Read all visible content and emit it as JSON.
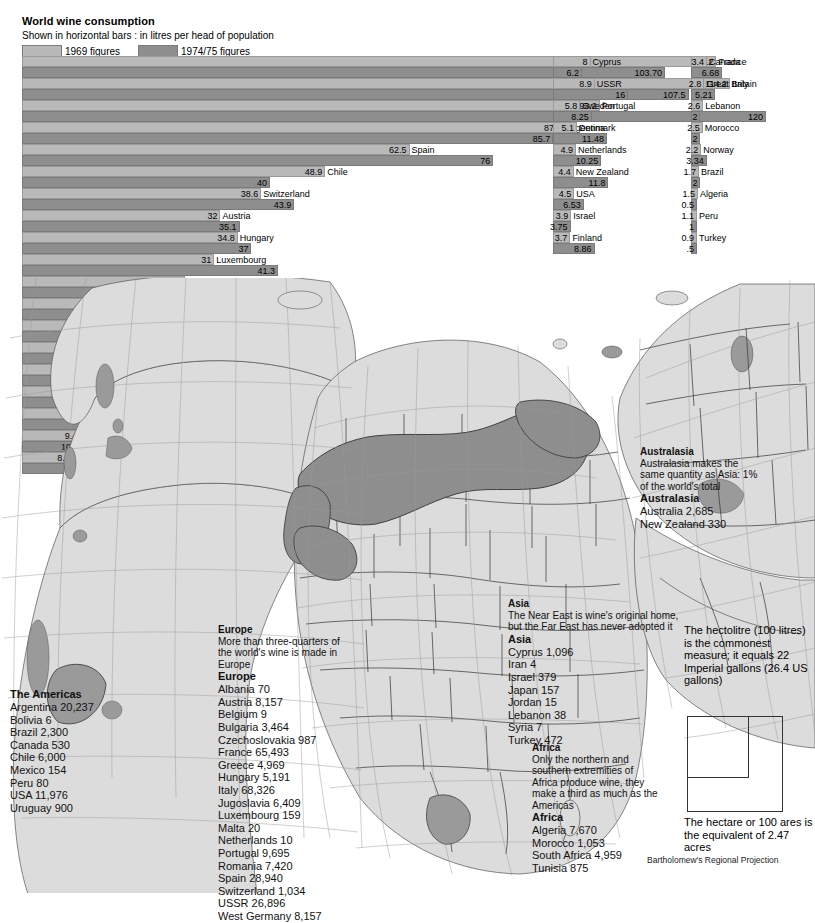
{
  "header": {
    "title": "World wine consumption",
    "subtitle": "Shown in horizontal bars : in litres per head of population",
    "legend": [
      {
        "label": "1969 figures",
        "color": "#b9b9b9"
      },
      {
        "label": "1974/75 figures",
        "color": "#8e8e8e"
      }
    ]
  },
  "chart_data": {
    "type": "bar",
    "title": "World wine consumption",
    "subtitle": "Shown in horizontal bars : in litres per head of population",
    "xlabel": "litres per head of population",
    "ylabel": "",
    "series": [
      {
        "name": "1969 figures",
        "color": "#b9b9b9"
      },
      {
        "name": "1974/75 figures",
        "color": "#8e8e8e"
      }
    ],
    "columns": [
      {
        "id": "column-1",
        "scale_px_per_litre": 6.2,
        "items": [
          {
            "country": "France",
            "v1969": 112,
            "v1975": 103.7,
            "l1969": "112",
            "l1975": "103.70"
          },
          {
            "country": "Italy",
            "v1969": 114.2,
            "v1975": 107.5,
            "l1969": "114.2",
            "l1975": "107.5"
          },
          {
            "country": "Portugal",
            "v1969": 93.2,
            "v1975": 120,
            "l1969": "93.2",
            "l1975": "120"
          },
          {
            "country": "Argentina",
            "v1969": 87.5,
            "v1975": 85.7,
            "l1969": "87.5",
            "l1975": "85.7"
          },
          {
            "country": "Spain",
            "v1969": 62.5,
            "v1975": 76,
            "l1969": "62.5",
            "l1975": "76"
          },
          {
            "country": "Chile",
            "v1969": 48.9,
            "v1975": 40,
            "l1969": "48.9",
            "l1975": "40"
          },
          {
            "country": "Switzerland",
            "v1969": 38.6,
            "v1975": 43.9,
            "l1969": "38.6",
            "l1975": "43.9"
          },
          {
            "country": "Austria",
            "v1969": 32,
            "v1975": 35.1,
            "l1969": "32",
            "l1975": "35.1"
          },
          {
            "country": "Hungary",
            "v1969": 34.8,
            "v1975": 37,
            "l1969": "34.8",
            "l1975": "37"
          },
          {
            "country": "Luxembourg",
            "v1969": 31,
            "v1975": 41.3,
            "l1969": "31",
            "l1975": "41.3"
          },
          {
            "country": "Yugoslavia",
            "v1969": 26.3,
            "v1975": 28.6,
            "l1969": "26.3",
            "l1975": "28.6"
          },
          {
            "country": "Uruguay",
            "v1969": 25,
            "v1975": 25.1,
            "l1969": "25",
            "l1975": "25.1"
          },
          {
            "country": "Romania",
            "v1969": 25,
            "v1975": 33,
            "l1969": "25",
            "l1975": "33"
          },
          {
            "country": "Bulgaria",
            "v1969": 21.7,
            "v1975": 19.98,
            "l1969": "21.7",
            "l1975": "19.98"
          },
          {
            "country": "Czechoslovakia",
            "v1969": 20,
            "v1975": 15,
            "l1969": "20",
            "l1975": "15"
          },
          {
            "country": "West Germany",
            "v1969": 15.9,
            "v1975": 23.2,
            "l1969": "15.9",
            "l1975": "23.2"
          },
          {
            "country": "Belgium",
            "v1969": 12.1,
            "v1975": 17.2,
            "l1969": "12.1",
            "l1975": "17.2"
          },
          {
            "country": "South Africa",
            "v1969": 9.4,
            "v1975": 10.41,
            "l1969": "9.4",
            "l1975": "10.41"
          },
          {
            "country": "Australia",
            "v1969": 8.2,
            "v1975": 11.2,
            "l1969": "8.2",
            "l1975": "11.2"
          }
        ]
      },
      {
        "id": "column-2",
        "scale_px_per_litre": 4.7,
        "items": [
          {
            "country": "Cyprus",
            "v1969": 8,
            "v1975": 6.2,
            "l1969": "8",
            "l1975": "6.2"
          },
          {
            "country": "USSR",
            "v1969": 8.9,
            "v1975": 16,
            "l1969": "8.9",
            "l1975": "16"
          },
          {
            "country": "Sweden",
            "v1969": 5.8,
            "v1975": 8.25,
            "l1969": "5.8",
            "l1975": "8.25"
          },
          {
            "country": "Denmark",
            "v1969": 5.1,
            "v1975": 11.48,
            "l1969": "5.1",
            "l1975": "11.48"
          },
          {
            "country": "Netherlands",
            "v1969": 4.9,
            "v1975": 10.25,
            "l1969": "4.9",
            "l1975": "10.25"
          },
          {
            "country": "New Zealand",
            "v1969": 4.4,
            "v1975": 11.8,
            "l1969": "4.4",
            "l1975": "11.8"
          },
          {
            "country": "USA",
            "v1969": 4.5,
            "v1975": 6.53,
            "l1969": "4.5",
            "l1975": "6.53"
          },
          {
            "country": "Israel",
            "v1969": 3.9,
            "v1975": 3.75,
            "l1969": "3.9",
            "l1975": "3.75"
          },
          {
            "country": "Finland",
            "v1969": 3.7,
            "v1975": 8.86,
            "l1969": "3.7",
            "l1975": "8.86"
          }
        ]
      },
      {
        "id": "column-3",
        "scale_px_per_litre": 4.7,
        "items": [
          {
            "country": "Canada",
            "v1969": 3.4,
            "v1975": 6.68,
            "l1969": "3.4",
            "l1975": "6.68"
          },
          {
            "country": "Great Britain",
            "v1969": 2.8,
            "v1975": 5.21,
            "l1969": "2.8",
            "l1975": "5.21"
          },
          {
            "country": "Lebanon",
            "v1969": 2.6,
            "v1975": 2,
            "l1969": "2.6",
            "l1975": "2"
          },
          {
            "country": "Morocco",
            "v1969": 2.5,
            "v1975": 2,
            "l1969": "2.5",
            "l1975": "2"
          },
          {
            "country": "Norway",
            "v1969": 2.2,
            "v1975": 3.34,
            "l1969": "2.2",
            "l1975": "3.34"
          },
          {
            "country": "Brazil",
            "v1969": 1.7,
            "v1975": 2,
            "l1969": "1.7",
            "l1975": "2"
          },
          {
            "country": "Algeria",
            "v1969": 1.5,
            "v1975": 0.5,
            "l1969": "1.5",
            "l1975": "0.5"
          },
          {
            "country": "Peru",
            "v1969": 1.1,
            "v1975": 1,
            "l1969": "1.1",
            "l1975": "1"
          },
          {
            "country": "Turkey",
            "v1969": 0.9,
            "v1975": 0.5,
            "l1969": "0.9",
            "l1975": ".5"
          }
        ]
      }
    ]
  },
  "map": {
    "projection_credit": "Bartholomew's Regional Projection",
    "land_color": "#dcdcdc",
    "wine_region_color": "#8e8e8e",
    "notes": {
      "americas": {
        "heading": "The Americas",
        "items": [
          "Argentina 20,237",
          "Bolivia 6",
          "Brazil 2,300",
          "Canada 530",
          "Chile 6,000",
          "Mexico 154",
          "Peru 80",
          "USA 11,976",
          "Uruguay 900"
        ]
      },
      "europe": {
        "heading": "Europe",
        "body": "More than three-quarters of the world's wine is made in Europe",
        "heading2": "Europe",
        "items": [
          "Albania 70",
          "Austria 8,157",
          "Belgium 9",
          "Bulgaria 3,464",
          "Czechoslovakia 987",
          "France 65,493",
          "Greece 4,969",
          "Hungary 5,191",
          "Italy 68,326",
          "Jugoslavia 6,409",
          "Luxembourg 159",
          "Malta 20",
          "Netherlands 10",
          "Portugal 9,695",
          "Romania 7,420",
          "Spain 28,940",
          "Switzerland 1,034",
          "USSR 26,896",
          "West Germany 8,157"
        ]
      },
      "asia": {
        "heading": "Asia",
        "body": "The Near East is wine's original home, but the Far East has never adopted it",
        "heading2": "Asia",
        "items": [
          "Cyprus 1,096",
          "Iran 4",
          "Israel 379",
          "Japan 157",
          "Jordan 15",
          "Lebanon 38",
          "Syria 7",
          "Turkey 472"
        ]
      },
      "africa": {
        "heading": "Africa",
        "body": "Only the northern and southern extremities of Africa produce wine, they make a third as much as the Americas",
        "heading2": "Africa",
        "items": [
          "Algeria 7,670",
          "Morocco 1,053",
          "South Africa 4,959",
          "Tunisia 875"
        ]
      },
      "australasia": {
        "heading": "Australasia",
        "body": "Australasia makes the same quantity as Asia: 1% of the world's total",
        "heading2": "Australasia",
        "items": [
          "Australia 2,685",
          "New Zealand 330"
        ]
      }
    }
  },
  "measures": {
    "hectolitre_note": "The hectolitre (100 litres) is the commonest measure; it equals 22 Imperial gallons (26.4 US gallons)",
    "hectare_note": "The hectare or 100 ares is the equivalent of 2.47 acres"
  }
}
